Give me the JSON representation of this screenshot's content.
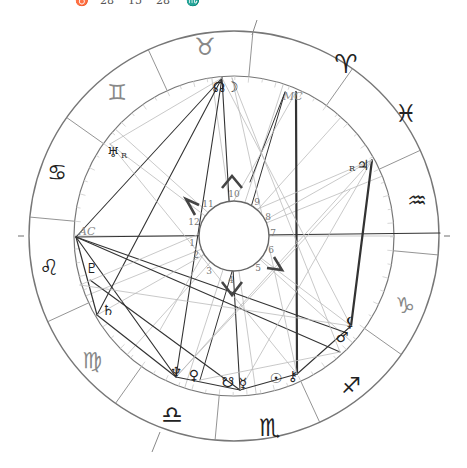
{
  "top_strip": {
    "values": [
      "♉",
      "28",
      "15",
      "28",
      "♏"
    ]
  },
  "wheel": {
    "center": [
      234,
      236
    ],
    "outer_radius": 205,
    "zodiac_inner_radius": 160,
    "hub_radius": 35,
    "ring_color": "#777777",
    "aspect_dark": "#333333",
    "aspect_light": "#bbbbbb",
    "signs": [
      {
        "name": "Aries",
        "glyph": "♈",
        "x": 346,
        "y": 64,
        "size": 26,
        "tone": "dark"
      },
      {
        "name": "Taurus",
        "glyph": "♉",
        "x": 205,
        "y": 47,
        "size": 24,
        "tone": "light"
      },
      {
        "name": "Gemini",
        "glyph": "♊",
        "x": 117,
        "y": 92,
        "size": 22,
        "tone": "light"
      },
      {
        "name": "Cancer",
        "glyph": "♋",
        "x": 57,
        "y": 172,
        "size": 22,
        "tone": "dark"
      },
      {
        "name": "Leo",
        "glyph": "♌",
        "x": 49,
        "y": 267,
        "size": 22,
        "tone": "dark"
      },
      {
        "name": "Virgo",
        "glyph": "♍",
        "x": 92,
        "y": 360,
        "size": 22,
        "tone": "light"
      },
      {
        "name": "Libra",
        "glyph": "♎",
        "x": 172,
        "y": 415,
        "size": 24,
        "tone": "dark"
      },
      {
        "name": "Scorpio",
        "glyph": "♏",
        "x": 270,
        "y": 428,
        "size": 24,
        "tone": "dark"
      },
      {
        "name": "Sagittarius",
        "glyph": "♐",
        "x": 351,
        "y": 385,
        "size": 22,
        "tone": "dark"
      },
      {
        "name": "Capricorn",
        "glyph": "♑",
        "x": 405,
        "y": 305,
        "size": 22,
        "tone": "light"
      },
      {
        "name": "Aquarius",
        "glyph": "♒",
        "x": 417,
        "y": 200,
        "size": 22,
        "tone": "dark"
      },
      {
        "name": "Pisces",
        "glyph": "♓",
        "x": 406,
        "y": 114,
        "size": 24,
        "tone": "dark"
      }
    ],
    "sign_divider_start_deg": 174.7,
    "house_numbers": [
      {
        "n": "1",
        "x": 192,
        "y": 243
      },
      {
        "n": "2",
        "x": 196,
        "y": 255
      },
      {
        "n": "3",
        "x": 209,
        "y": 271
      },
      {
        "n": "4",
        "x": 231,
        "y": 280
      },
      {
        "n": "5",
        "x": 258,
        "y": 268
      },
      {
        "n": "6",
        "x": 271,
        "y": 250
      },
      {
        "n": "7",
        "x": 273,
        "y": 233
      },
      {
        "n": "8",
        "x": 268,
        "y": 217
      },
      {
        "n": "9",
        "x": 257,
        "y": 202
      },
      {
        "n": "10",
        "x": 234,
        "y": 194
      },
      {
        "n": "11",
        "x": 208,
        "y": 204
      },
      {
        "n": "12",
        "x": 194,
        "y": 222
      }
    ],
    "house_cusp_angles_deg": [
      180,
      202,
      228,
      252,
      278,
      318,
      0,
      22,
      48,
      72,
      98,
      138
    ],
    "quadrant_chevrons": [
      {
        "name": "top",
        "points": "222,188 232,176 242,188"
      },
      {
        "name": "left",
        "points": "199,205 186,199 195,215"
      },
      {
        "name": "right",
        "points": "274,257 282,270 267,268"
      },
      {
        "name": "bottom",
        "points": "222,282 232,295 242,282"
      }
    ],
    "axes": {
      "asc": {
        "label": "AC",
        "x": 76,
        "y": 237
      },
      "mc": {
        "label": "MC",
        "x": 289,
        "y": 95
      }
    },
    "planets": [
      {
        "name": "North Node",
        "glyph": "☊",
        "x": 219,
        "y": 87,
        "retro": false
      },
      {
        "name": "Moon",
        "glyph": "☽",
        "x": 232,
        "y": 87,
        "retro": false
      },
      {
        "name": "Uranus",
        "glyph": "♅",
        "x": 113,
        "y": 152,
        "retro": true
      },
      {
        "name": "Jupiter",
        "glyph": "♃",
        "x": 363,
        "y": 165,
        "retro": true
      },
      {
        "name": "Pluto",
        "glyph": "♇",
        "x": 92,
        "y": 268,
        "retro": false
      },
      {
        "name": "Saturn",
        "glyph": "♄",
        "x": 108,
        "y": 310,
        "retro": false
      },
      {
        "name": "Lilith",
        "glyph": "⚸",
        "x": 350,
        "y": 322,
        "retro": false
      },
      {
        "name": "Mars",
        "glyph": "♂",
        "x": 342,
        "y": 337,
        "retro": false
      },
      {
        "name": "Neptune",
        "glyph": "♆",
        "x": 176,
        "y": 372,
        "retro": false
      },
      {
        "name": "Venus",
        "glyph": "♀",
        "x": 194,
        "y": 375,
        "retro": false
      },
      {
        "name": "South Node",
        "glyph": "☋",
        "x": 228,
        "y": 382,
        "retro": false
      },
      {
        "name": "Mercury",
        "glyph": "☿",
        "x": 243,
        "y": 383,
        "retro": false
      },
      {
        "name": "Sun",
        "glyph": "☉",
        "x": 276,
        "y": 378,
        "retro": false
      },
      {
        "name": "Chiron",
        "glyph": "⚷",
        "x": 293,
        "y": 376,
        "retro": false
      }
    ],
    "retro_label": "R",
    "aspect_lines": [
      {
        "x1": 296,
        "y1": 92,
        "x2": 297,
        "y2": 374,
        "w": 2.2,
        "tone": "dark"
      },
      {
        "x1": 372,
        "y1": 160,
        "x2": 351,
        "y2": 326,
        "w": 2.2,
        "tone": "dark"
      },
      {
        "x1": 76,
        "y1": 237,
        "x2": 222,
        "y2": 78,
        "w": 1.1,
        "tone": "dark"
      },
      {
        "x1": 76,
        "y1": 237,
        "x2": 440,
        "y2": 233,
        "w": 1.2,
        "tone": "dark"
      },
      {
        "x1": 76,
        "y1": 237,
        "x2": 347,
        "y2": 333,
        "w": 1.1,
        "tone": "dark"
      },
      {
        "x1": 76,
        "y1": 237,
        "x2": 340,
        "y2": 352,
        "w": 1.1,
        "tone": "dark"
      },
      {
        "x1": 76,
        "y1": 237,
        "x2": 176,
        "y2": 377,
        "w": 1.2,
        "tone": "dark"
      },
      {
        "x1": 76,
        "y1": 237,
        "x2": 97,
        "y2": 315,
        "w": 1.2,
        "tone": "dark"
      },
      {
        "x1": 97,
        "y1": 315,
        "x2": 176,
        "y2": 377,
        "w": 1.2,
        "tone": "dark"
      },
      {
        "x1": 97,
        "y1": 315,
        "x2": 222,
        "y2": 78,
        "w": 1.1,
        "tone": "dark"
      },
      {
        "x1": 222,
        "y1": 78,
        "x2": 176,
        "y2": 377,
        "w": 1.1,
        "tone": "dark"
      },
      {
        "x1": 222,
        "y1": 78,
        "x2": 240,
        "y2": 390,
        "w": 1.1,
        "tone": "dark"
      },
      {
        "x1": 176,
        "y1": 377,
        "x2": 240,
        "y2": 390,
        "w": 1.1,
        "tone": "dark"
      },
      {
        "x1": 240,
        "y1": 390,
        "x2": 297,
        "y2": 374,
        "w": 1.1,
        "tone": "dark"
      },
      {
        "x1": 297,
        "y1": 374,
        "x2": 351,
        "y2": 326,
        "w": 1.1,
        "tone": "dark"
      },
      {
        "x1": 90,
        "y1": 280,
        "x2": 240,
        "y2": 390,
        "w": 1.1,
        "tone": "dark"
      },
      {
        "x1": 285,
        "y1": 92,
        "x2": 200,
        "y2": 380,
        "w": 1.0,
        "tone": "dark"
      },
      {
        "x1": 285,
        "y1": 92,
        "x2": 250,
        "y2": 182,
        "w": 1.0,
        "tone": "dark"
      },
      {
        "x1": 110,
        "y1": 144,
        "x2": 351,
        "y2": 326,
        "w": 0.8,
        "tone": "light"
      },
      {
        "x1": 110,
        "y1": 144,
        "x2": 297,
        "y2": 374,
        "w": 0.8,
        "tone": "light"
      },
      {
        "x1": 110,
        "y1": 144,
        "x2": 222,
        "y2": 78,
        "w": 0.8,
        "tone": "light"
      },
      {
        "x1": 372,
        "y1": 160,
        "x2": 80,
        "y2": 285,
        "w": 0.8,
        "tone": "light"
      },
      {
        "x1": 372,
        "y1": 160,
        "x2": 240,
        "y2": 390,
        "w": 0.8,
        "tone": "light"
      },
      {
        "x1": 372,
        "y1": 160,
        "x2": 176,
        "y2": 377,
        "w": 0.8,
        "tone": "light"
      },
      {
        "x1": 222,
        "y1": 78,
        "x2": 351,
        "y2": 326,
        "w": 0.8,
        "tone": "light"
      },
      {
        "x1": 232,
        "y1": 78,
        "x2": 340,
        "y2": 352,
        "w": 0.8,
        "tone": "light"
      },
      {
        "x1": 232,
        "y1": 78,
        "x2": 297,
        "y2": 374,
        "w": 0.8,
        "tone": "light"
      },
      {
        "x1": 97,
        "y1": 315,
        "x2": 372,
        "y2": 160,
        "w": 0.8,
        "tone": "light"
      },
      {
        "x1": 80,
        "y1": 285,
        "x2": 351,
        "y2": 326,
        "w": 0.8,
        "tone": "light"
      },
      {
        "x1": 176,
        "y1": 377,
        "x2": 350,
        "y2": 190,
        "w": 0.8,
        "tone": "light"
      },
      {
        "x1": 200,
        "y1": 380,
        "x2": 340,
        "y2": 352,
        "w": 0.8,
        "tone": "light"
      },
      {
        "x1": 296,
        "y1": 92,
        "x2": 160,
        "y2": 330,
        "w": 0.8,
        "tone": "light"
      }
    ]
  }
}
